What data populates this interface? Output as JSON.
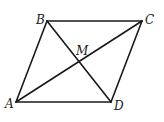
{
  "diagram": {
    "type": "parallelogram-with-diagonals",
    "stroke_color": "#1a1a1a",
    "background": "#ffffff",
    "points": {
      "A": {
        "label": "A",
        "x": 16,
        "y": 102,
        "lx": 5,
        "ly": 108
      },
      "B": {
        "label": "B",
        "x": 47,
        "y": 21,
        "lx": 36,
        "ly": 24
      },
      "C": {
        "label": "C",
        "x": 142,
        "y": 21,
        "lx": 145,
        "ly": 24
      },
      "D": {
        "label": "D",
        "x": 111,
        "y": 102,
        "lx": 114,
        "ly": 110
      },
      "M": {
        "label": "M",
        "x": 79,
        "y": 61,
        "lx": 76,
        "ly": 55
      }
    },
    "segments": [
      {
        "name": "side-AB",
        "from": "A",
        "to": "B"
      },
      {
        "name": "side-BC",
        "from": "B",
        "to": "C"
      },
      {
        "name": "side-CD",
        "from": "C",
        "to": "D"
      },
      {
        "name": "side-DA",
        "from": "D",
        "to": "A"
      },
      {
        "name": "diagonal-AC",
        "from": "A",
        "to": "C"
      },
      {
        "name": "diagonal-BD",
        "from": "B",
        "to": "D"
      }
    ]
  }
}
